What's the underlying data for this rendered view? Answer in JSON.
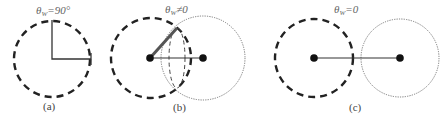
{
  "panels": [
    {
      "caption": "(a)",
      "theta_symbol": "θ",
      "theta_subscript": "W",
      "theta_relation": "=90°"
    },
    {
      "caption": "(b)",
      "theta_symbol": "θ",
      "theta_subscript": "W",
      "theta_relation": "≠0"
    },
    {
      "caption": "(c)",
      "theta_symbol": "θ",
      "theta_subscript": "W",
      "theta_relation": "=0"
    }
  ],
  "colors": {
    "dashed_circle": "#222222",
    "dotted_circle": "#777777",
    "line": "#333333",
    "thick_line": "#555555",
    "dot": "#111111"
  }
}
